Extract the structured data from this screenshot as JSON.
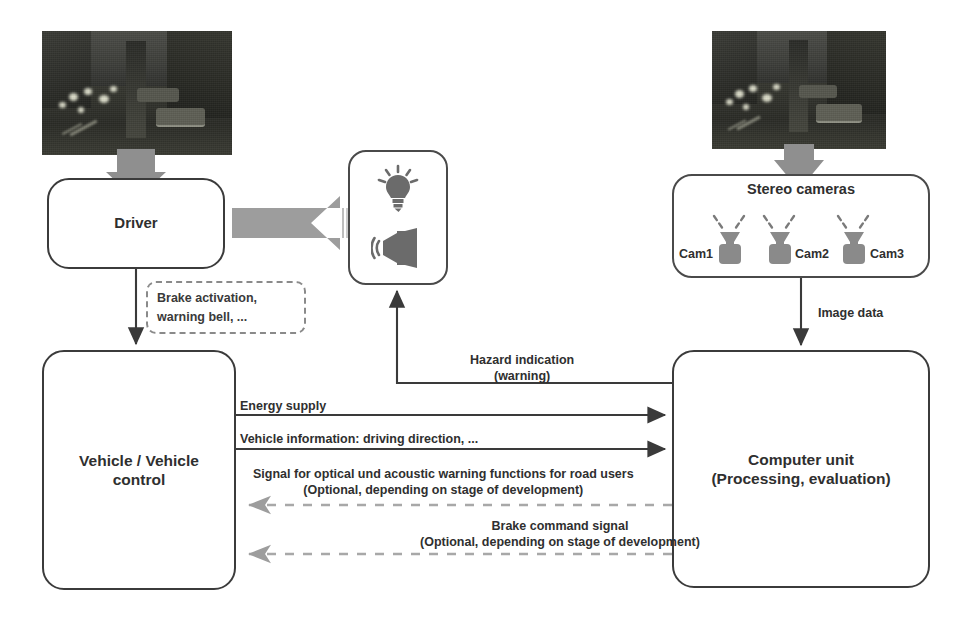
{
  "diagram": {
    "colors": {
      "node_border": "#3b3b3b",
      "solid_edge": "#3a3a3a",
      "gray_edge": "#9a9a9a",
      "gray_arrow_fill": "#9d9d9d",
      "dashed_callout": "#8a8a8a",
      "text": "#2f2f2f"
    },
    "nodes": {
      "driver": {
        "label": "Driver"
      },
      "vehicle_control": {
        "line1": "Vehicle / Vehicle",
        "line2": "control"
      },
      "warning_output": {
        "icons": [
          "lightbulb-icon",
          "speaker-icon"
        ]
      },
      "stereo_cameras": {
        "title": "Stereo cameras",
        "cameras": [
          {
            "label": "Cam1"
          },
          {
            "label": "Cam2"
          },
          {
            "label": "Cam3"
          }
        ]
      },
      "computer_unit": {
        "line1": "Computer unit",
        "line2": "(Processing, evaluation)"
      }
    },
    "photos": {
      "left": {
        "caption": "night traffic scene photo"
      },
      "right": {
        "caption": "night traffic scene photo"
      }
    },
    "callout": {
      "line1": "Brake activation,",
      "line2": "warning bell, ..."
    },
    "edges": [
      {
        "name": "image-to-driver",
        "label": "",
        "style": "gray-block-arrow",
        "direction": "down"
      },
      {
        "name": "warning-to-driver",
        "label": "",
        "style": "gray-block-arrow",
        "direction": "left"
      },
      {
        "name": "driver-to-vehicle",
        "label": "",
        "style": "solid",
        "direction": "down"
      },
      {
        "name": "image-to-cameras",
        "label": "",
        "style": "gray-block-arrow",
        "direction": "down"
      },
      {
        "name": "cameras-to-computer",
        "label": "Image data",
        "style": "solid",
        "direction": "down"
      },
      {
        "name": "computer-to-warning",
        "label_line1": "Hazard indication",
        "label_line2": "(warning)",
        "style": "solid",
        "direction": "up-left"
      },
      {
        "name": "vehicle-to-computer-energy",
        "label": "Energy supply",
        "style": "solid",
        "direction": "right"
      },
      {
        "name": "vehicle-to-computer-info",
        "label": "Vehicle information: driving direction, ...",
        "style": "solid",
        "direction": "right"
      },
      {
        "name": "computer-to-vehicle-warnsignal",
        "label_line1": "Signal for optical und acoustic warning functions for road users",
        "label_line2": "(Optional, depending on stage of development)",
        "style": "dashed-gray",
        "direction": "left"
      },
      {
        "name": "computer-to-vehicle-brake",
        "label_line1": "Brake command signal",
        "label_line2": "(Optional, depending on stage of development)",
        "style": "dashed-gray",
        "direction": "left"
      }
    ],
    "labels": {
      "energy_supply": "Energy supply",
      "vehicle_information": "Vehicle information: driving direction, ...",
      "signal_line1": "Signal for optical und acoustic warning functions for road users",
      "signal_line2": "(Optional, depending on stage of development)",
      "brake_line1": "Brake command signal",
      "brake_line2": "(Optional, depending on stage of development)",
      "hazard_line1": "Hazard indication",
      "hazard_line2": "(warning)",
      "image_data": "Image data"
    }
  }
}
